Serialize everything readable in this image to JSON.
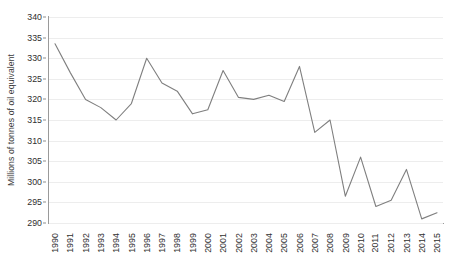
{
  "chart_data": {
    "type": "line",
    "title": "",
    "xlabel": "",
    "ylabel": "Millions of tonnes of oil equivalent",
    "ylim": [
      290,
      340
    ],
    "ytick_step": 5,
    "yticks": [
      340,
      335,
      330,
      325,
      320,
      315,
      310,
      305,
      300,
      295,
      290
    ],
    "grid": true,
    "legend": "none",
    "line_color": "#7f7f7f",
    "gridline_color": "#ededed",
    "axis_color": "#9a9a9a",
    "categories": [
      "1990",
      "1991",
      "1992",
      "1993",
      "1994",
      "1995",
      "1996",
      "1997",
      "1998",
      "1999",
      "2000",
      "2001",
      "2002",
      "2003",
      "2004",
      "2005",
      "2006",
      "2007",
      "2008",
      "2009",
      "2010",
      "2011",
      "2012",
      "2013",
      "2014",
      "2015"
    ],
    "values": [
      333.5,
      326.5,
      320.0,
      318.0,
      315.0,
      319.0,
      330.0,
      324.0,
      322.0,
      316.5,
      317.5,
      327.0,
      320.5,
      320.0,
      321.0,
      319.5,
      328.0,
      312.0,
      315.0,
      296.5,
      306.0,
      294.0,
      295.5,
      303.0,
      291.0,
      292.5
    ],
    "series": [
      {
        "name": "Millions of tonnes of oil equivalent",
        "values": [
          333.5,
          326.5,
          320.0,
          318.0,
          315.0,
          319.0,
          330.0,
          324.0,
          322.0,
          316.5,
          317.5,
          327.0,
          320.5,
          320.0,
          321.0,
          319.5,
          328.0,
          312.0,
          315.0,
          296.5,
          306.0,
          294.0,
          295.5,
          303.0,
          291.0,
          292.5
        ]
      }
    ]
  }
}
